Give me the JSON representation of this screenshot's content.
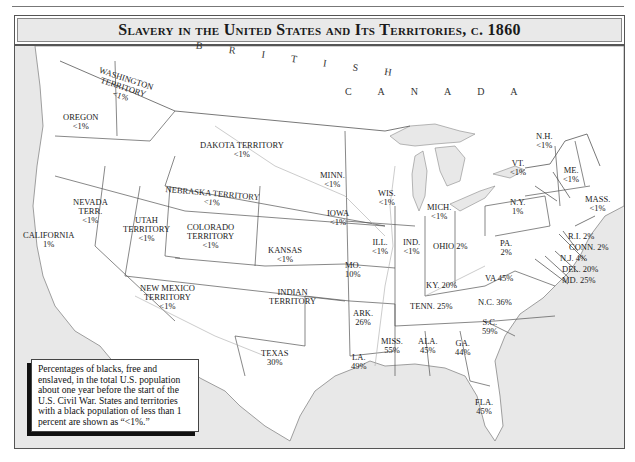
{
  "title": "Slavery in the United States and Its Territories, c. 1860",
  "colors": {
    "water": "#e6e6e6",
    "land": "#ffffff",
    "border": "#555555",
    "river": "#aaaaaa",
    "title_bar": "#e9e9e9"
  },
  "countries": [
    {
      "id": "british",
      "label": "B R I T I S H"
    },
    {
      "id": "canada",
      "label": "C A N A D A"
    }
  ],
  "regions": [
    {
      "id": "washington",
      "name": "WASHINGTON TERRITORY",
      "lines": [
        "WASHINGTON",
        "TERRITORY"
      ],
      "value": "<1%"
    },
    {
      "id": "oregon",
      "name": "OREGON",
      "lines": [
        "OREGON"
      ],
      "value": "<1%"
    },
    {
      "id": "dakota",
      "name": "DAKOTA TERRITORY",
      "lines": [
        "DAKOTA TERRITORY"
      ],
      "value": "<1%"
    },
    {
      "id": "nebraska",
      "name": "NEBRASKA TERRITORY",
      "lines": [
        "NEBRASKA TERRITORY"
      ],
      "value": "<1%"
    },
    {
      "id": "nevada",
      "name": "NEVADA TERR.",
      "lines": [
        "NEVADA",
        "TERR."
      ],
      "value": "<1%"
    },
    {
      "id": "utah",
      "name": "UTAH TERRITORY",
      "lines": [
        "UTAH",
        "TERRITORY"
      ],
      "value": "<1%"
    },
    {
      "id": "colorado",
      "name": "COLORADO TERRITORY",
      "lines": [
        "COLORADO",
        "TERRITORY"
      ],
      "value": "<1%"
    },
    {
      "id": "california",
      "name": "CALIFORNIA",
      "lines": [
        "CALIFORNIA"
      ],
      "value": "1%"
    },
    {
      "id": "kansas",
      "name": "KANSAS",
      "lines": [
        "KANSAS"
      ],
      "value": "<1%"
    },
    {
      "id": "new-mexico",
      "name": "NEW MEXICO TERRITORY",
      "lines": [
        "NEW MEXICO",
        "TERRITORY"
      ],
      "value": "<1%"
    },
    {
      "id": "indian",
      "name": "INDIAN TERRITORY",
      "lines": [
        "INDIAN",
        "TERRITORY"
      ],
      "value": ""
    },
    {
      "id": "texas",
      "name": "TEXAS",
      "lines": [
        "TEXAS"
      ],
      "value": "30%"
    },
    {
      "id": "minn",
      "name": "MINN.",
      "lines": [
        "MINN."
      ],
      "value": "<1%"
    },
    {
      "id": "iowa",
      "name": "IOWA",
      "lines": [
        "IOWA"
      ],
      "value": "<1%"
    },
    {
      "id": "mo",
      "name": "MO.",
      "lines": [
        "MO."
      ],
      "value": "10%"
    },
    {
      "id": "ark",
      "name": "ARK.",
      "lines": [
        "ARK."
      ],
      "value": "26%"
    },
    {
      "id": "la",
      "name": "LA.",
      "lines": [
        "LA."
      ],
      "value": "49%"
    },
    {
      "id": "wis",
      "name": "WIS.",
      "lines": [
        "WIS."
      ],
      "value": "<1%"
    },
    {
      "id": "ill",
      "name": "ILL.",
      "lines": [
        "ILL."
      ],
      "value": "<1%"
    },
    {
      "id": "mich",
      "name": "MICH.",
      "lines": [
        "MICH."
      ],
      "value": "<1%"
    },
    {
      "id": "ind",
      "name": "IND.",
      "lines": [
        "IND."
      ],
      "value": "<1%"
    },
    {
      "id": "ohio",
      "name": "OHIO",
      "lines": [
        "OHIO 2%"
      ],
      "value": "2%"
    },
    {
      "id": "ky",
      "name": "KY.",
      "lines": [
        "KY. 20%"
      ],
      "value": "20%"
    },
    {
      "id": "tenn",
      "name": "TENN.",
      "lines": [
        "TENN. 25%"
      ],
      "value": "25%"
    },
    {
      "id": "miss",
      "name": "MISS.",
      "lines": [
        "MISS."
      ],
      "value": "55%"
    },
    {
      "id": "ala",
      "name": "ALA.",
      "lines": [
        "ALA."
      ],
      "value": "45%"
    },
    {
      "id": "ga",
      "name": "GA.",
      "lines": [
        "GA."
      ],
      "value": "44%"
    },
    {
      "id": "fla",
      "name": "FLA.",
      "lines": [
        "FLA."
      ],
      "value": "45%"
    },
    {
      "id": "sc",
      "name": "S.C.",
      "lines": [
        "S.C."
      ],
      "value": "59%"
    },
    {
      "id": "nc",
      "name": "N.C.",
      "lines": [
        "N.C. 36%"
      ],
      "value": "36%"
    },
    {
      "id": "va",
      "name": "VA",
      "lines": [
        "VA 45%"
      ],
      "value": "45%"
    },
    {
      "id": "pa",
      "name": "PA.",
      "lines": [
        "PA."
      ],
      "value": "2%"
    },
    {
      "id": "ny",
      "name": "N.Y.",
      "lines": [
        "N.Y."
      ],
      "value": "1%"
    },
    {
      "id": "vt",
      "name": "VT.",
      "lines": [
        "VT."
      ],
      "value": "<1%"
    },
    {
      "id": "nh",
      "name": "N.H.",
      "lines": [
        "N.H."
      ],
      "value": "<1%"
    },
    {
      "id": "me",
      "name": "ME.",
      "lines": [
        "ME."
      ],
      "value": "<1%"
    },
    {
      "id": "mass",
      "name": "MASS.",
      "lines": [
        "MASS."
      ],
      "value": "<1%"
    },
    {
      "id": "ri",
      "name": "R.I.",
      "lines": [
        "R.I. 2%"
      ],
      "value": "2%"
    },
    {
      "id": "conn",
      "name": "CONN.",
      "lines": [
        "CONN. 2%"
      ],
      "value": "2%"
    },
    {
      "id": "nj",
      "name": "N.J.",
      "lines": [
        "N.J. 4%"
      ],
      "value": "4%"
    },
    {
      "id": "del",
      "name": "DEL.",
      "lines": [
        "DEL. 20%"
      ],
      "value": "20%"
    },
    {
      "id": "md",
      "name": "MD.",
      "lines": [
        "MD. 25%"
      ],
      "value": "25%"
    }
  ],
  "note": "Percentages of blacks, free and enslaved, in the total U.S. population about one year before the start of the U.S. Civil War. States and territories with a black population of less than 1 percent are shown as “<1%.”"
}
